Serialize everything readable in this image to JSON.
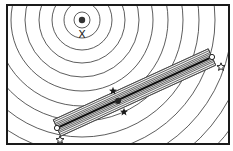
{
  "diagram": {
    "frame": {
      "x": 7,
      "y": 5,
      "width": 222,
      "height": 139,
      "stroke": "#1a1a1a"
    },
    "contours": {
      "center": {
        "x": 82,
        "y": 20
      },
      "radii": [
        8,
        18,
        30,
        43,
        57,
        71,
        86,
        101,
        117,
        133,
        150,
        167,
        184,
        202,
        220
      ],
      "stroke": "#333333"
    },
    "optimum_marker": {
      "label": "dot",
      "x": 82,
      "y": 20,
      "r": 3.2,
      "fill": "#333333"
    },
    "x_marker": {
      "label": "X",
      "x": 82,
      "y": 34
    },
    "band": {
      "start": {
        "x": 57,
        "y": 128
      },
      "end": {
        "x": 212,
        "y": 57
      },
      "offsets": [
        -9,
        -7,
        -5,
        -3.5,
        -2,
        2,
        3.5,
        5,
        7,
        9
      ],
      "stroke": "#444444",
      "center_stroke": "#111111"
    },
    "center_dot": {
      "x": 118,
      "y": 101,
      "r": 3,
      "fill": "#222222"
    },
    "filled_stars": [
      {
        "x": 113,
        "y": 91
      },
      {
        "x": 124,
        "y": 112
      }
    ],
    "open_circles": [
      {
        "x": 57,
        "y": 128
      },
      {
        "x": 212,
        "y": 57
      }
    ],
    "open_stars": [
      {
        "x": 60,
        "y": 140
      },
      {
        "x": 221,
        "y": 67
      }
    ]
  }
}
